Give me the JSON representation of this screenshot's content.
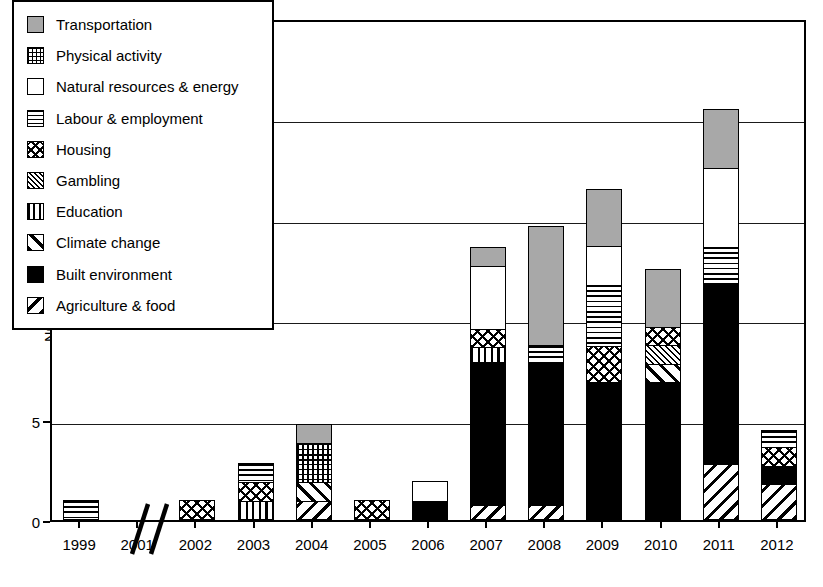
{
  "chart_data": {
    "type": "bar",
    "subtype": "stacked-bar",
    "title": "",
    "xlabel": "",
    "ylabel": "Number of HIA",
    "ylim": [
      0,
      25
    ],
    "yticks": [
      0,
      5,
      10,
      15,
      20,
      25
    ],
    "ytick_labels": [
      "0",
      "5",
      "10",
      "15",
      "20",
      "25"
    ],
    "grid": "horizontal",
    "legend_position": "top-left-inside",
    "axis_break": {
      "after_category": "1999",
      "at_category": "2001",
      "glyph": "double-slash"
    },
    "categories": [
      "1999",
      "2001",
      "2002",
      "2003",
      "2004",
      "2005",
      "2006",
      "2007",
      "2008",
      "2009",
      "2010",
      "2011",
      "2012"
    ],
    "series": [
      {
        "name": "Agriculture & food",
        "pattern": "p-diag-back",
        "values": [
          0,
          0,
          0,
          0,
          1,
          0,
          0,
          0.8,
          0.8,
          0,
          0,
          2.8,
          1.8
        ]
      },
      {
        "name": "Built environment",
        "pattern": "p-solid-black",
        "values": [
          0,
          0,
          0,
          0,
          0,
          0,
          1,
          7.2,
          7.2,
          6.9,
          6.9,
          9.0,
          1.0
        ]
      },
      {
        "name": "Climate change",
        "pattern": "p-diag-fwd",
        "values": [
          0,
          0,
          0,
          0,
          1,
          0,
          0,
          0,
          0,
          0,
          1.0,
          0,
          0
        ]
      },
      {
        "name": "Education",
        "pattern": "p-vert",
        "values": [
          0,
          0,
          0,
          1,
          0,
          0,
          0,
          0.8,
          0,
          0,
          0,
          0,
          0
        ]
      },
      {
        "name": "Gambling",
        "pattern": "p-hatch-dense",
        "values": [
          0,
          0,
          0,
          0,
          0,
          0,
          0,
          0,
          0,
          0,
          1.0,
          0,
          0
        ]
      },
      {
        "name": "Housing",
        "pattern": "p-xhatch",
        "values": [
          0,
          0,
          1,
          1,
          0,
          1,
          0,
          1.0,
          0,
          1.9,
          1.0,
          0,
          1.0
        ]
      },
      {
        "name": "Labour & employment",
        "pattern": "p-horiz",
        "values": [
          1,
          0,
          0,
          1,
          0,
          0,
          0,
          0,
          0.9,
          3.1,
          0,
          2.0,
          0.9
        ]
      },
      {
        "name": "Natural resources & energy",
        "pattern": "p-empty",
        "values": [
          0,
          0,
          0,
          0,
          0,
          0,
          1,
          3.2,
          0,
          2.0,
          0,
          4.0,
          0
        ]
      },
      {
        "name": "Physical activity",
        "pattern": "p-grid",
        "values": [
          0,
          0,
          0,
          0,
          2,
          0,
          0,
          0,
          0,
          0,
          0,
          0,
          0
        ]
      },
      {
        "name": "Transportation",
        "pattern": "p-solid-gray",
        "values": [
          0,
          0,
          0,
          0,
          1,
          0,
          0,
          1.0,
          6.0,
          2.9,
          2.9,
          3.0,
          0
        ]
      }
    ],
    "totals": [
      1,
      0,
      1,
      3,
      5,
      1,
      2,
      14,
      14.9,
      16.9,
      12.8,
      20.8,
      4.7
    ]
  },
  "legend": {
    "items": [
      {
        "label": "Transportation",
        "pattern": "p-solid-gray",
        "icon": "legend-swatch-transportation"
      },
      {
        "label": "Physical activity",
        "pattern": "p-grid",
        "icon": "legend-swatch-physical-activity"
      },
      {
        "label": "Natural resources & energy",
        "pattern": "p-empty",
        "icon": "legend-swatch-natural-resources-energy"
      },
      {
        "label": "Labour & employment",
        "pattern": "p-horiz",
        "icon": "legend-swatch-labour-employment"
      },
      {
        "label": "Housing",
        "pattern": "p-xhatch",
        "icon": "legend-swatch-housing"
      },
      {
        "label": "Gambling",
        "pattern": "p-hatch-dense",
        "icon": "legend-swatch-gambling"
      },
      {
        "label": "Education",
        "pattern": "p-vert",
        "icon": "legend-swatch-education"
      },
      {
        "label": "Climate change",
        "pattern": "p-diag-fwd",
        "icon": "legend-swatch-climate-change"
      },
      {
        "label": "Built environment",
        "pattern": "p-solid-black",
        "icon": "legend-swatch-built-environment"
      },
      {
        "label": "Agriculture & food",
        "pattern": "p-diag-back",
        "icon": "legend-swatch-agriculture-food"
      }
    ]
  },
  "colors": {
    "axis": "#000000",
    "gridline": "#1a1a1a",
    "transportation_fill": "#a8a8a8",
    "built_environment_fill": "#000000",
    "background": "#ffffff"
  }
}
